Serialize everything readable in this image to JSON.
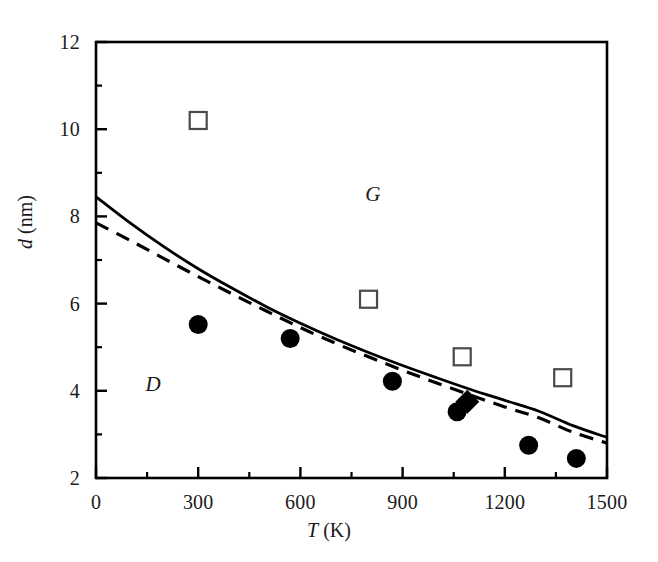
{
  "chart_data": {
    "type": "scatter",
    "title": "",
    "xlabel": "T (K)",
    "ylabel": "d (nm)",
    "xlim": [
      0,
      1500
    ],
    "ylim": [
      2,
      12
    ],
    "grid": false,
    "legend": "none",
    "x_ticks_major": [
      0,
      300,
      600,
      900,
      1200,
      1500
    ],
    "x_ticks_minor": [
      150,
      450,
      750,
      1050,
      1350
    ],
    "x_tick_labels": [
      "0",
      "300",
      "600",
      "900",
      "1200",
      "1500"
    ],
    "y_ticks_major": [
      2,
      4,
      6,
      8,
      10,
      12
    ],
    "y_ticks_minor": [
      3,
      5,
      7,
      9,
      11
    ],
    "y_tick_labels": [
      "2",
      "4",
      "6",
      "8",
      "10",
      "12"
    ],
    "annotations": [
      {
        "text": "G",
        "x": 820,
        "y": 8.48,
        "style": "italic"
      },
      {
        "text": "D",
        "x": 175,
        "y": 4.13,
        "style": "italic"
      }
    ],
    "series": [
      {
        "name": "filled-circles",
        "marker": "filled-circle",
        "color": "#000000",
        "points": [
          {
            "x": 300,
            "y": 5.52
          },
          {
            "x": 570,
            "y": 5.2
          },
          {
            "x": 870,
            "y": 4.22
          },
          {
            "x": 1060,
            "y": 3.52
          },
          {
            "x": 1270,
            "y": 2.75
          },
          {
            "x": 1410,
            "y": 2.45
          }
        ]
      },
      {
        "name": "open-squares",
        "marker": "open-square",
        "color": "#000000",
        "points": [
          {
            "x": 300,
            "y": 10.2
          },
          {
            "x": 800,
            "y": 6.1
          },
          {
            "x": 1075,
            "y": 4.78
          },
          {
            "x": 1370,
            "y": 4.3
          }
        ]
      },
      {
        "name": "filled-diamond",
        "marker": "filled-diamond",
        "color": "#000000",
        "points": [
          {
            "x": 1090,
            "y": 3.75
          }
        ]
      },
      {
        "name": "solid-curve",
        "marker": "none",
        "line": "solid",
        "color": "#000000",
        "points": [
          {
            "x": 0,
            "y": 8.45
          },
          {
            "x": 100,
            "y": 7.85
          },
          {
            "x": 200,
            "y": 7.3
          },
          {
            "x": 300,
            "y": 6.8
          },
          {
            "x": 400,
            "y": 6.35
          },
          {
            "x": 500,
            "y": 5.93
          },
          {
            "x": 600,
            "y": 5.55
          },
          {
            "x": 700,
            "y": 5.2
          },
          {
            "x": 800,
            "y": 4.88
          },
          {
            "x": 900,
            "y": 4.58
          },
          {
            "x": 1000,
            "y": 4.3
          },
          {
            "x": 1100,
            "y": 4.03
          },
          {
            "x": 1200,
            "y": 3.78
          },
          {
            "x": 1300,
            "y": 3.53
          },
          {
            "x": 1400,
            "y": 3.2
          },
          {
            "x": 1500,
            "y": 2.93
          }
        ]
      },
      {
        "name": "dashed-curve",
        "marker": "none",
        "line": "dashed",
        "color": "#000000",
        "points": [
          {
            "x": 0,
            "y": 7.85
          },
          {
            "x": 100,
            "y": 7.45
          },
          {
            "x": 200,
            "y": 7.03
          },
          {
            "x": 300,
            "y": 6.62
          },
          {
            "x": 400,
            "y": 6.22
          },
          {
            "x": 500,
            "y": 5.83
          },
          {
            "x": 600,
            "y": 5.45
          },
          {
            "x": 700,
            "y": 5.1
          },
          {
            "x": 800,
            "y": 4.78
          },
          {
            "x": 900,
            "y": 4.47
          },
          {
            "x": 1000,
            "y": 4.18
          },
          {
            "x": 1100,
            "y": 3.9
          },
          {
            "x": 1200,
            "y": 3.63
          },
          {
            "x": 1300,
            "y": 3.38
          },
          {
            "x": 1400,
            "y": 3.05
          },
          {
            "x": 1500,
            "y": 2.8
          }
        ]
      }
    ]
  },
  "axes": {
    "y_title_var": "d",
    "y_title_unit": " (nm)",
    "x_title_var": "T",
    "x_title_unit": " (K)"
  }
}
